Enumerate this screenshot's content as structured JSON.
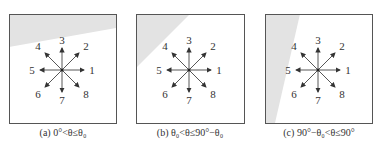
{
  "panels": [
    {
      "id": "a",
      "caption": "(a) 0°<θ≤θ₀",
      "box": [
        9,
        14,
        107,
        109
      ],
      "shade": "9,14 116,14 116,28 9,47",
      "center": [
        62,
        70
      ]
    },
    {
      "id": "b",
      "caption": "(b) θ₀<θ≤90°−θ₀",
      "box": [
        136,
        14,
        108,
        109
      ],
      "shade": "136,14 190,14 136,68",
      "center": [
        189,
        70
      ]
    },
    {
      "id": "c",
      "caption": "(c) 90°−θ₀<θ≤90°",
      "box": [
        265,
        14,
        107,
        109
      ],
      "shade": "265,14 300,14 275,123 265,123",
      "center": [
        318,
        70
      ]
    }
  ],
  "directions": [
    "1",
    "2",
    "3",
    "4",
    "5",
    "6",
    "7",
    "8"
  ],
  "colors": {
    "shade": "#e3e3e3",
    "stroke": "#555555"
  }
}
